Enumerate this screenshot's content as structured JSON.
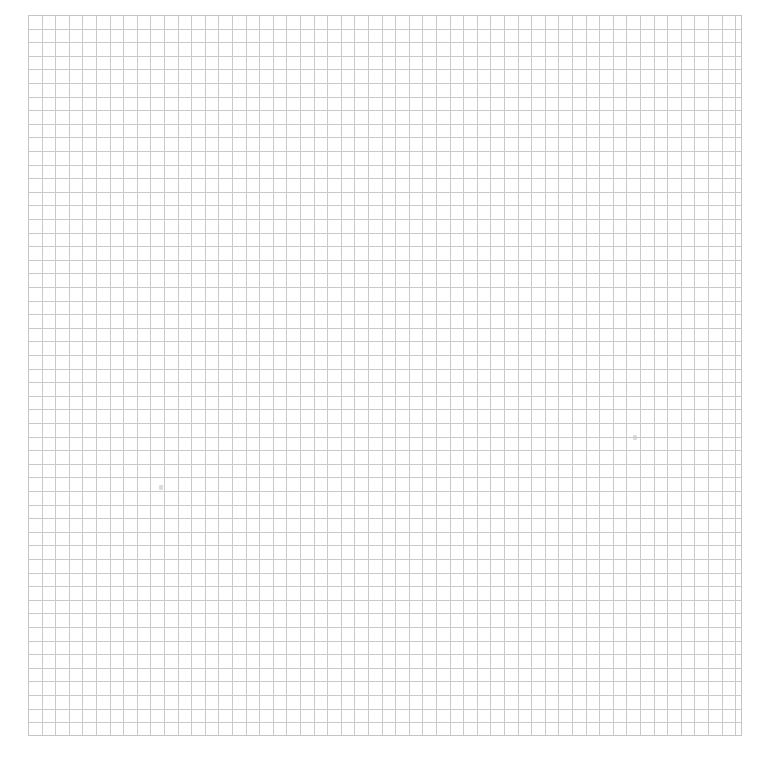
{
  "page": {
    "width": 757,
    "height": 762,
    "background_color": "#ffffff"
  },
  "grid": {
    "label": "Blank square grid paper",
    "line_color": "#c9c9cc",
    "edge_line_color": "#c4c4c7",
    "line_width_px": 1,
    "cell_size_px": 13.6,
    "origin_x_px": 28,
    "origin_y_px": 15,
    "area_width_px": 714,
    "area_height_px": 721,
    "columns": 53,
    "rows": 53,
    "major_lines": false,
    "axis_labels": false,
    "tick_labels": false
  },
  "marks": [
    {
      "name": "smudge-left",
      "x": 159,
      "y": 485,
      "width": 4,
      "height": 5,
      "color": "#bfbfc2"
    },
    {
      "name": "smudge-right",
      "x": 633,
      "y": 435,
      "width": 4,
      "height": 5,
      "color": "#bfbfc2"
    }
  ],
  "chart_data": {
    "type": "table",
    "title": "",
    "subtitle": "",
    "xlabel": "",
    "ylabel": "",
    "categories": [],
    "values": [],
    "series": [],
    "legend": [],
    "annotations": [],
    "grid": true,
    "legend_position": "none",
    "note": "Empty grid paper — no plotted data, no axis ticks, no legend, no title."
  }
}
